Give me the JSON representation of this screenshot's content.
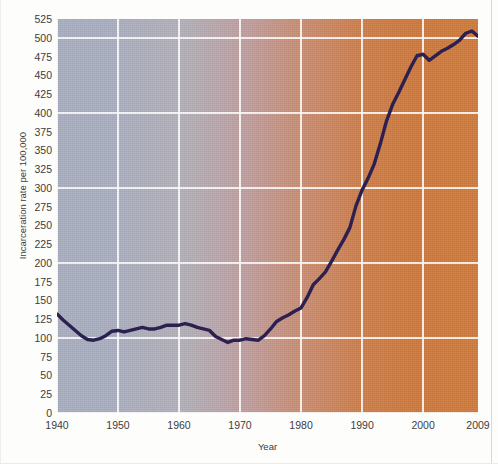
{
  "figure": {
    "title": "",
    "background_color": "#fdfdfc"
  },
  "axes": {
    "y_label": "Incarceration rate per 100,000",
    "x_label": "Year",
    "y_ticks": [
      "0",
      "25",
      "50",
      "75",
      "100",
      "125",
      "150",
      "175",
      "200",
      "225",
      "250",
      "275",
      "300",
      "325",
      "350",
      "375",
      "400",
      "425",
      "450",
      "475",
      "500",
      "525"
    ],
    "x_ticks": [
      "1940",
      "1950",
      "1960",
      "1970",
      "1980",
      "1990",
      "2000",
      "2009"
    ]
  },
  "colors": {
    "line": "#2b2050",
    "gridline": "#ffffff",
    "plot_left": "#a9aec1",
    "plot_right": "#cf7c3e",
    "tick_text": "#3c3c3c"
  },
  "chart_data": {
    "type": "line",
    "title": "",
    "xlabel": "Year",
    "ylabel": "Incarceration rate per 100,000",
    "xlim": [
      1940,
      2009
    ],
    "ylim": [
      0,
      525
    ],
    "y_tick_step": 25,
    "x_tick_step": 10,
    "grid": true,
    "grid_horizontal_step": 100,
    "grid_vertical_step": 10,
    "legend": "none",
    "series": [
      {
        "name": "Incarceration rate per 100,000",
        "color": "#2b2050",
        "x": [
          1940,
          1941,
          1942,
          1943,
          1944,
          1945,
          1946,
          1947,
          1948,
          1949,
          1950,
          1951,
          1952,
          1953,
          1954,
          1955,
          1956,
          1957,
          1958,
          1959,
          1960,
          1961,
          1962,
          1963,
          1964,
          1965,
          1966,
          1967,
          1968,
          1969,
          1970,
          1971,
          1972,
          1973,
          1974,
          1975,
          1976,
          1977,
          1978,
          1979,
          1980,
          1981,
          1982,
          1983,
          1984,
          1985,
          1986,
          1987,
          1988,
          1989,
          1990,
          1991,
          1992,
          1993,
          1994,
          1995,
          1996,
          1997,
          1998,
          1999,
          2000,
          2001,
          2002,
          2003,
          2004,
          2005,
          2006,
          2007,
          2008,
          2009
        ],
        "y": [
          132,
          124,
          117,
          110,
          103,
          98,
          97,
          99,
          103,
          109,
          110,
          108,
          110,
          112,
          114,
          112,
          112,
          114,
          117,
          117,
          117,
          119,
          117,
          114,
          112,
          110,
          102,
          98,
          94,
          97,
          97,
          99,
          98,
          97,
          103,
          112,
          122,
          127,
          131,
          136,
          140,
          154,
          171,
          179,
          188,
          202,
          217,
          231,
          247,
          276,
          297,
          313,
          332,
          359,
          389,
          411,
          427,
          444,
          461,
          476,
          478,
          470,
          476,
          482,
          486,
          491,
          497,
          506,
          509,
          502
        ]
      }
    ]
  }
}
